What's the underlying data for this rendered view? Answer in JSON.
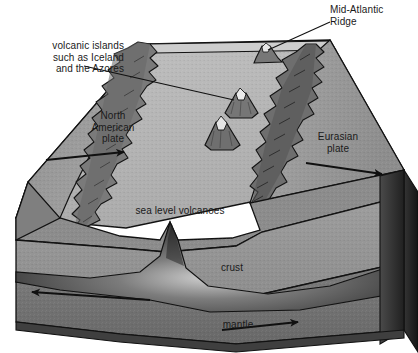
{
  "figure": {
    "type": "cross-section-block-diagram"
  },
  "labels": {
    "volcanic_islands": "volcanic islands\nsuch as Iceland\nand the Azores",
    "mid_atlantic_ridge": "Mid-Atlantic\nRidge",
    "north_american_plate": "North\nAmerican\nplate",
    "eurasian_plate": "Eurasian\nplate",
    "sea_level_volcanoes": "sea level volcanoes",
    "crust": "crust",
    "mantle": "mantle"
  },
  "icons": {
    "arrow_left_plate": "arrow-left-icon",
    "arrow_right_plate": "arrow-right-icon",
    "arrow_left_mantle": "arrow-left-icon",
    "arrow_right_mantle": "arrow-right-icon",
    "leader_line_islands": "leader-line-icon",
    "leader_line_ridge": "leader-line-icon"
  },
  "colors": {
    "background": "#ffffff",
    "outline": "#111111",
    "top_plain_light": "#b6b6b6",
    "plate_surface": "#9c9c9c",
    "plate_surface_dark": "#8e8e8e",
    "ridge_mountains": "#7d7d7d",
    "ridge_mountains_dark": "#5f5f5f",
    "volcano_body": "#7a7a7a",
    "volcano_peak": "#e8e8e8",
    "crust_band_upper": "#8a8a8a",
    "crust_band_mid": "#a0a0a0",
    "mantle_band": "#6f6f6f",
    "mantle_band_dark": "#4a4a4a",
    "plume": "#3a3a3a",
    "side_face_dark": "#3c3c3c",
    "side_face_darker": "#262626",
    "sea_surface_strip": "#cfcfcf",
    "text": "#1a1a1a"
  },
  "features": {
    "plates": [
      "North American plate",
      "Eurasian plate"
    ],
    "spreading_direction_left": "west",
    "spreading_direction_right": "east",
    "layers": [
      "crust",
      "mantle"
    ],
    "volcano_count_on_plain": 3,
    "ridge_count": 2
  }
}
